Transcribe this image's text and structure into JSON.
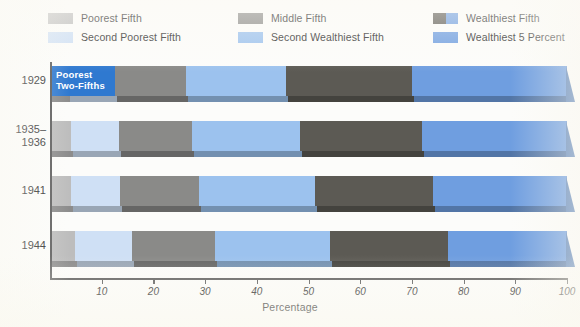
{
  "legend": {
    "rows": [
      [
        {
          "label": "Poorest Fifth",
          "swatch": "poorest-fifth",
          "colors": [
            "#bdbdbd"
          ],
          "x": 0
        },
        {
          "label": "Middle Fifth",
          "swatch": "middle-fifth",
          "colors": [
            "#8a8a88"
          ],
          "x": 190
        },
        {
          "label": "Wealthiest Fifth",
          "swatch": "wealthiest-fifth",
          "colors": [
            "#5c5a54",
            "#6f9ee0"
          ],
          "x": 385
        }
      ],
      [
        {
          "label": "Second Poorest Fifth",
          "swatch": "second-poorest-fifth",
          "colors": [
            "#cfe0f5"
          ],
          "x": 0
        },
        {
          "label": "Second Wealthiest Fifth",
          "swatch": "second-wealthiest-fifth",
          "colors": [
            "#9cc2ee"
          ],
          "x": 190
        },
        {
          "label": "Wealthiest 5 Percent",
          "swatch": "wealthiest-5-percent",
          "colors": [
            "#6f9ee0"
          ],
          "x": 385
        }
      ]
    ]
  },
  "annotation": {
    "callout_line1": "Poorest",
    "callout_line2": "Two-Fifths"
  },
  "chart_data": {
    "type": "bar",
    "orientation": "horizontal",
    "stacked": true,
    "title": "",
    "xlabel": "Percentage",
    "ylabel": "",
    "xlim": [
      0,
      100
    ],
    "xticks": [
      0,
      10,
      20,
      30,
      40,
      50,
      60,
      70,
      80,
      90,
      100
    ],
    "xtick_labels": [
      "",
      "10",
      "20",
      "30",
      "40",
      "50",
      "60",
      "70",
      "80",
      "90",
      "100"
    ],
    "grid": false,
    "legend_position": "top",
    "categories": [
      "1929",
      "1935–1936",
      "1941",
      "1944"
    ],
    "category_labels": [
      {
        "line1": "1929",
        "line2": ""
      },
      {
        "line1": "1935–",
        "line2": "1936"
      },
      {
        "line1": "1941",
        "line2": ""
      },
      {
        "line1": "1944",
        "line2": ""
      }
    ],
    "series": [
      {
        "name": "Poorest Fifth",
        "color": "#bdbdbd",
        "values": [
          3.5,
          4.1,
          4.1,
          4.9
        ]
      },
      {
        "name": "Second Poorest Fifth",
        "color": "#cfe0f5",
        "values": [
          9.0,
          9.2,
          9.5,
          10.9
        ]
      },
      {
        "name": "Middle Fifth",
        "color": "#8a8a88",
        "values": [
          13.8,
          14.1,
          15.3,
          16.2
        ]
      },
      {
        "name": "Second Wealthiest Fifth",
        "color": "#9cc2ee",
        "values": [
          19.3,
          20.9,
          22.3,
          22.2
        ]
      },
      {
        "name": "Wealthiest Fifth",
        "color": "#5c5a54",
        "values": [
          24.4,
          23.7,
          22.8,
          22.8
        ]
      },
      {
        "name": "Wealthiest 5 Percent",
        "color": "#6f9ee0",
        "values": [
          30.0,
          28.0,
          26.0,
          23.0
        ]
      }
    ],
    "bar_boundaries_percent": [
      {
        "category": "1929",
        "edges": [
          0,
          3.5,
          12.5,
          26.3,
          45.6,
          70.0,
          100
        ]
      },
      {
        "category": "1935–1936",
        "edges": [
          0,
          4.1,
          13.3,
          27.4,
          48.3,
          72.0,
          100
        ]
      },
      {
        "category": "1941",
        "edges": [
          0,
          4.1,
          13.6,
          28.9,
          51.2,
          74.0,
          100
        ]
      },
      {
        "category": "1944",
        "edges": [
          0,
          4.9,
          15.8,
          32.0,
          54.2,
          77.0,
          100
        ]
      }
    ]
  }
}
